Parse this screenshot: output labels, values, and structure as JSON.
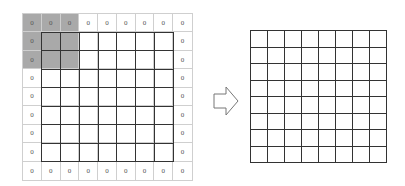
{
  "diagram": {
    "input_grid": {
      "rows": 9,
      "cols": 9,
      "padding_value": "0",
      "padding_cells": {
        "top_row": [
          "0",
          "0",
          "0",
          "0",
          "0",
          "0",
          "0",
          "0",
          "0"
        ],
        "bottom_row": [
          "0",
          "0",
          "0",
          "0",
          "0",
          "0",
          "0",
          "0",
          "0"
        ],
        "left_col": [
          "0",
          "0",
          "0",
          "0",
          "0",
          "0",
          "0",
          "0",
          "0"
        ],
        "right_col": [
          "0",
          "0",
          "0",
          "0",
          "0",
          "0",
          "0",
          "0",
          "0"
        ]
      },
      "inner_size": [
        7,
        7
      ],
      "shaded_window": {
        "row": 0,
        "col": 0,
        "size": 3,
        "color": "#a9a9a9"
      }
    },
    "arrow": {
      "direction": "right",
      "style": "outline"
    },
    "output_grid": {
      "rows": 8,
      "cols": 8
    },
    "colors": {
      "padding_border": "#cfcfcf",
      "inner_border": "#333333",
      "shade": "#a9a9a9",
      "text": "#555555"
    }
  }
}
